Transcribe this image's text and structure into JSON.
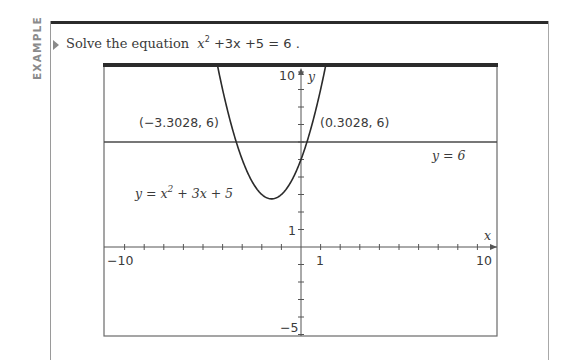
{
  "sidebar_tag": "EXAMPLE",
  "prompt": {
    "lead": "Solve the equation",
    "equation_parts": {
      "var": "x",
      "exp": "2",
      "rest": " +3x +5 = 6 ."
    }
  },
  "chart_data": {
    "type": "line",
    "title": "",
    "xlabel": "x",
    "ylabel": "y",
    "xlim": [
      -10,
      10
    ],
    "ylim": [
      -5,
      10.3
    ],
    "grid": false,
    "x_tick_step": 1,
    "y_tick_step": 1,
    "x_tick_labels": [
      {
        "value": -10,
        "label": "−10"
      },
      {
        "value": 1,
        "label": "1"
      },
      {
        "value": 10,
        "label": "10"
      }
    ],
    "y_tick_labels": [
      {
        "value": 10,
        "label": "10"
      },
      {
        "value": 1,
        "label": "1"
      },
      {
        "value": -5,
        "label": "−5"
      }
    ],
    "series": [
      {
        "name": "y = x² + 3x + 5",
        "kind": "function",
        "expression": "x^2 + 3x + 5",
        "label_main": "y = x",
        "label_exp": "2",
        "label_rest": " + 3x + 5"
      },
      {
        "name": "y = 6",
        "kind": "horizontal",
        "value": 6,
        "label": "y = 6"
      }
    ],
    "annotations": [
      {
        "text": "(−3.3028, 6)",
        "x": -3.3028,
        "y": 6
      },
      {
        "text": "(0.3028, 6)",
        "x": 0.3028,
        "y": 6
      }
    ]
  },
  "colors": {
    "curve": "#2b2b2b",
    "axis": "#555555",
    "frame_top": "#2b2b2b",
    "text": "#3a3a3a",
    "tag": "#8a8a8a"
  }
}
